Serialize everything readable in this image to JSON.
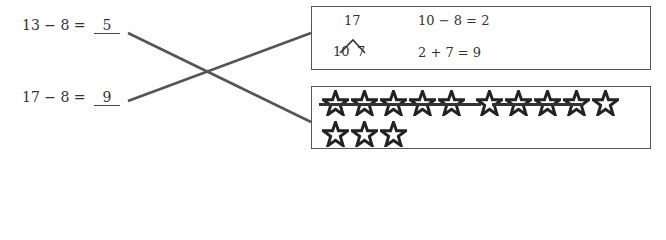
{
  "problems": [
    {
      "expression": "13 − 8 =",
      "answer": "5"
    },
    {
      "expression": "17 − 8 =",
      "answer": "9"
    }
  ],
  "decomposition_box": {
    "whole": "17",
    "parts": [
      "10",
      "7"
    ],
    "steps": [
      "10 − 8 = 2",
      "2 + 7 = 9"
    ]
  },
  "star_box": {
    "total_stars": 13,
    "crossed_out": 8,
    "row1_count": 10,
    "row2_count": 3
  },
  "connections": [
    {
      "from": "problem-13-8",
      "to": "star-box"
    },
    {
      "from": "problem-17-8",
      "to": "decomposition-box"
    }
  ],
  "colors": {
    "line": "#555555",
    "text": "#333333"
  }
}
